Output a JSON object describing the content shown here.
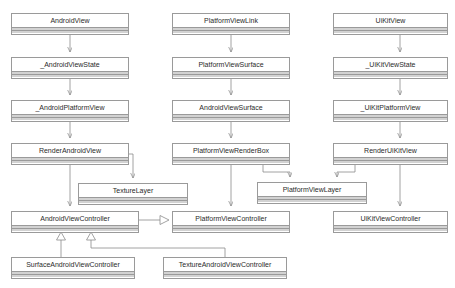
{
  "diagram": {
    "type": "uml-class-diagram",
    "background_color": "#ffffff",
    "box_border_color": "#9a9a9a",
    "compartment_fill_color": "#d2d2d2",
    "edge_color": "#8c8c8c",
    "text_color": "#2b2b2b"
  },
  "classes": [
    {
      "id": "android_view",
      "name": "AndroidView",
      "x": 11,
      "y": 13,
      "w": 118,
      "h": 22,
      "column": "android"
    },
    {
      "id": "android_view_state",
      "name": "_AndroidViewState",
      "x": 11,
      "y": 57,
      "w": 118,
      "h": 22,
      "column": "android"
    },
    {
      "id": "android_platform_view",
      "name": "_AndroidPlatformView",
      "x": 11,
      "y": 100,
      "w": 118,
      "h": 22,
      "column": "android"
    },
    {
      "id": "render_android_view",
      "name": "RenderAndroidView",
      "x": 11,
      "y": 143,
      "w": 118,
      "h": 22,
      "column": "android"
    },
    {
      "id": "texture_layer",
      "name": "TextureLayer",
      "x": 78,
      "y": 183,
      "w": 110,
      "h": 22,
      "column": "layer"
    },
    {
      "id": "android_view_controller",
      "name": "AndroidViewController",
      "x": 11,
      "y": 211,
      "w": 128,
      "h": 22,
      "column": "android"
    },
    {
      "id": "surface_android_vc",
      "name": "SurfaceAndroidViewController",
      "x": 11,
      "y": 257,
      "w": 124,
      "h": 22,
      "column": "android"
    },
    {
      "id": "texture_android_vc",
      "name": "TextureAndroidViewController",
      "x": 163,
      "y": 257,
      "w": 124,
      "h": 22,
      "column": "platform"
    },
    {
      "id": "platform_view_link",
      "name": "PlatformViewLink",
      "x": 172,
      "y": 13,
      "w": 118,
      "h": 22,
      "column": "platform"
    },
    {
      "id": "platform_view_surface",
      "name": "PlatformViewSurface",
      "x": 172,
      "y": 57,
      "w": 118,
      "h": 22,
      "column": "platform"
    },
    {
      "id": "android_view_surface",
      "name": "AndroidViewSurface",
      "x": 172,
      "y": 100,
      "w": 118,
      "h": 22,
      "column": "platform"
    },
    {
      "id": "platform_view_renderbox",
      "name": "PlatformViewRenderBox",
      "x": 172,
      "y": 143,
      "w": 118,
      "h": 22,
      "column": "platform"
    },
    {
      "id": "platform_view_layer",
      "name": "PlatformViewLayer",
      "x": 257,
      "y": 182,
      "w": 110,
      "h": 22,
      "column": "layer"
    },
    {
      "id": "platform_view_controller",
      "name": "PlatformViewController",
      "x": 172,
      "y": 211,
      "w": 118,
      "h": 22,
      "column": "platform"
    },
    {
      "id": "uikit_view",
      "name": "UiKitView",
      "x": 333,
      "y": 13,
      "w": 115,
      "h": 22,
      "column": "uikit"
    },
    {
      "id": "uikit_view_state",
      "name": "_UiKitViewState",
      "x": 333,
      "y": 57,
      "w": 115,
      "h": 22,
      "column": "uikit"
    },
    {
      "id": "uikit_platform_view",
      "name": "_UiKitPlatformView",
      "x": 333,
      "y": 100,
      "w": 115,
      "h": 22,
      "column": "uikit"
    },
    {
      "id": "render_uikit_view",
      "name": "RenderUiKitView",
      "x": 333,
      "y": 143,
      "w": 115,
      "h": 22,
      "column": "uikit"
    },
    {
      "id": "uikit_view_controller",
      "name": "UiKitViewController",
      "x": 333,
      "y": 211,
      "w": 115,
      "h": 22,
      "column": "uikit"
    }
  ],
  "edges": [
    {
      "id": "e1",
      "from": "android_view",
      "to": "android_view_state",
      "kind": "dependency-arrow"
    },
    {
      "id": "e2",
      "from": "android_view_state",
      "to": "android_platform_view",
      "kind": "dependency-arrow"
    },
    {
      "id": "e3",
      "from": "android_platform_view",
      "to": "render_android_view",
      "kind": "dependency-arrow"
    },
    {
      "id": "e4",
      "from": "render_android_view",
      "to": "texture_layer",
      "kind": "dependency-arrow-elbow"
    },
    {
      "id": "e5",
      "from": "render_android_view",
      "to": "android_view_controller",
      "kind": "dependency-arrow"
    },
    {
      "id": "e6",
      "from": "platform_view_link",
      "to": "platform_view_surface",
      "kind": "dependency-arrow"
    },
    {
      "id": "e7",
      "from": "platform_view_surface",
      "to": "android_view_surface",
      "kind": "dependency-arrow"
    },
    {
      "id": "e8",
      "from": "android_view_surface",
      "to": "platform_view_renderbox",
      "kind": "dependency-arrow"
    },
    {
      "id": "e9",
      "from": "platform_view_renderbox",
      "to": "platform_view_layer",
      "kind": "dependency-arrow-elbow"
    },
    {
      "id": "e10",
      "from": "platform_view_renderbox",
      "to": "platform_view_controller",
      "kind": "dependency-arrow"
    },
    {
      "id": "e11",
      "from": "uikit_view",
      "to": "uikit_view_state",
      "kind": "dependency-arrow"
    },
    {
      "id": "e12",
      "from": "uikit_view_state",
      "to": "uikit_platform_view",
      "kind": "dependency-arrow"
    },
    {
      "id": "e13",
      "from": "uikit_platform_view",
      "to": "render_uikit_view",
      "kind": "dependency-arrow"
    },
    {
      "id": "e14",
      "from": "render_uikit_view",
      "to": "platform_view_layer",
      "kind": "dependency-arrow-elbow"
    },
    {
      "id": "e15",
      "from": "render_uikit_view",
      "to": "uikit_view_controller",
      "kind": "dependency-arrow"
    },
    {
      "id": "e16",
      "from": "android_view_controller",
      "to": "platform_view_controller",
      "kind": "realization-hollow-triangle"
    },
    {
      "id": "e17",
      "from": "surface_android_vc",
      "to": "android_view_controller",
      "kind": "generalization-hollow-triangle"
    },
    {
      "id": "e18",
      "from": "texture_android_vc",
      "to": "android_view_controller",
      "kind": "generalization-hollow-triangle"
    }
  ]
}
